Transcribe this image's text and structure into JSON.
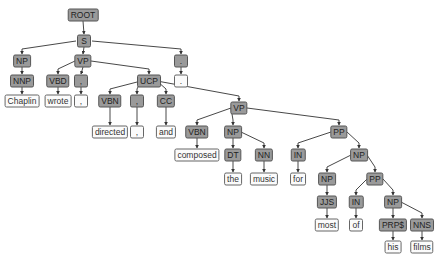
{
  "sentence": "Chaplin wrote , directed , and composed the music for most of his films .",
  "colors": {
    "tag_fill": "#9a9a9a",
    "word_fill": "#fbfbfb",
    "edge": "#333333"
  },
  "nodes": [
    {
      "id": "root",
      "label": "ROOT",
      "type": "tag",
      "x": 83,
      "y": 15
    },
    {
      "id": "s",
      "label": "S",
      "type": "tag",
      "x": 84,
      "y": 41
    },
    {
      "id": "np1",
      "label": "NP",
      "type": "tag",
      "x": 22,
      "y": 61
    },
    {
      "id": "vp1",
      "label": "VP",
      "type": "tag",
      "x": 83,
      "y": 61
    },
    {
      "id": "punct_s",
      "label": ".",
      "type": "tag",
      "x": 181,
      "y": 61
    },
    {
      "id": "nnp",
      "label": "NNP",
      "type": "tag",
      "x": 22,
      "y": 81
    },
    {
      "id": "vbd",
      "label": "VBD",
      "type": "tag",
      "x": 58,
      "y": 81
    },
    {
      "id": "comma1",
      "label": ",",
      "type": "tag",
      "x": 81,
      "y": 81
    },
    {
      "id": "ucp",
      "label": "UCP",
      "type": "tag",
      "x": 149,
      "y": 81
    },
    {
      "id": "dot_w",
      "label": ".",
      "type": "word",
      "x": 181,
      "y": 81
    },
    {
      "id": "w_chaplin",
      "label": "Chaplin",
      "type": "word",
      "x": 22,
      "y": 101
    },
    {
      "id": "w_wrote",
      "label": "wrote",
      "type": "word",
      "x": 58,
      "y": 101
    },
    {
      "id": "w_comma1",
      "label": ",",
      "type": "word",
      "x": 81,
      "y": 101
    },
    {
      "id": "vbn1",
      "label": "VBN",
      "type": "tag",
      "x": 110,
      "y": 101
    },
    {
      "id": "comma2",
      "label": ",",
      "type": "tag",
      "x": 137,
      "y": 101
    },
    {
      "id": "cc",
      "label": "CC",
      "type": "tag",
      "x": 166,
      "y": 101
    },
    {
      "id": "vp2",
      "label": "VP",
      "type": "tag",
      "x": 239,
      "y": 108
    },
    {
      "id": "w_directed",
      "label": "directed",
      "type": "word",
      "x": 110,
      "y": 132
    },
    {
      "id": "w_comma2",
      "label": ",",
      "type": "word",
      "x": 137,
      "y": 132
    },
    {
      "id": "w_and",
      "label": "and",
      "type": "word",
      "x": 166,
      "y": 132
    },
    {
      "id": "vbn2",
      "label": "VBN",
      "type": "tag",
      "x": 197,
      "y": 132
    },
    {
      "id": "np2",
      "label": "NP",
      "type": "tag",
      "x": 233,
      "y": 132
    },
    {
      "id": "pp1",
      "label": "PP",
      "type": "tag",
      "x": 339,
      "y": 132
    },
    {
      "id": "w_composed",
      "label": "composed",
      "type": "word",
      "x": 197,
      "y": 155
    },
    {
      "id": "dt",
      "label": "DT",
      "type": "tag",
      "x": 233,
      "y": 155
    },
    {
      "id": "nn",
      "label": "NN",
      "type": "tag",
      "x": 264,
      "y": 155
    },
    {
      "id": "in1",
      "label": "IN",
      "type": "tag",
      "x": 298,
      "y": 155
    },
    {
      "id": "np3",
      "label": "NP",
      "type": "tag",
      "x": 359,
      "y": 155
    },
    {
      "id": "w_the",
      "label": "the",
      "type": "word",
      "x": 233,
      "y": 179
    },
    {
      "id": "w_music",
      "label": "music",
      "type": "word",
      "x": 264,
      "y": 179
    },
    {
      "id": "w_for",
      "label": "for",
      "type": "word",
      "x": 298,
      "y": 179
    },
    {
      "id": "np4",
      "label": "NP",
      "type": "tag",
      "x": 327,
      "y": 179
    },
    {
      "id": "pp2",
      "label": "PP",
      "type": "tag",
      "x": 375,
      "y": 179
    },
    {
      "id": "jjs",
      "label": "JJS",
      "type": "tag",
      "x": 327,
      "y": 202
    },
    {
      "id": "in2",
      "label": "IN",
      "type": "tag",
      "x": 356,
      "y": 202
    },
    {
      "id": "np5",
      "label": "NP",
      "type": "tag",
      "x": 393,
      "y": 202
    },
    {
      "id": "w_most",
      "label": "most",
      "type": "word",
      "x": 327,
      "y": 225
    },
    {
      "id": "w_of",
      "label": "of",
      "type": "word",
      "x": 356,
      "y": 225
    },
    {
      "id": "prps",
      "label": "PRP$",
      "type": "tag",
      "x": 393,
      "y": 225
    },
    {
      "id": "nns",
      "label": "NNS",
      "type": "tag",
      "x": 422,
      "y": 225
    },
    {
      "id": "w_his",
      "label": "his",
      "type": "word",
      "x": 393,
      "y": 247
    },
    {
      "id": "w_films",
      "label": "films",
      "type": "word",
      "x": 422,
      "y": 247
    }
  ],
  "edges": [
    [
      "root",
      "s"
    ],
    [
      "s",
      "np1"
    ],
    [
      "s",
      "vp1"
    ],
    [
      "s",
      "punct_s"
    ],
    [
      "np1",
      "nnp"
    ],
    [
      "nnp",
      "w_chaplin"
    ],
    [
      "vp1",
      "vbd"
    ],
    [
      "vp1",
      "comma1"
    ],
    [
      "vp1",
      "ucp"
    ],
    [
      "punct_s",
      "dot_w"
    ],
    [
      "vbd",
      "w_wrote"
    ],
    [
      "comma1",
      "w_comma1"
    ],
    [
      "ucp",
      "vbn1"
    ],
    [
      "ucp",
      "comma2"
    ],
    [
      "ucp",
      "cc"
    ],
    [
      "ucp",
      "vp2"
    ],
    [
      "vbn1",
      "w_directed"
    ],
    [
      "comma2",
      "w_comma2"
    ],
    [
      "cc",
      "w_and"
    ],
    [
      "vp2",
      "vbn2"
    ],
    [
      "vp2",
      "np2"
    ],
    [
      "vp2",
      "pp1"
    ],
    [
      "vbn2",
      "w_composed"
    ],
    [
      "np2",
      "dt"
    ],
    [
      "np2",
      "nn"
    ],
    [
      "dt",
      "w_the"
    ],
    [
      "nn",
      "w_music"
    ],
    [
      "pp1",
      "in1"
    ],
    [
      "pp1",
      "np3"
    ],
    [
      "in1",
      "w_for"
    ],
    [
      "np3",
      "np4"
    ],
    [
      "np3",
      "pp2"
    ],
    [
      "np4",
      "jjs"
    ],
    [
      "jjs",
      "w_most"
    ],
    [
      "pp2",
      "in2"
    ],
    [
      "pp2",
      "np5"
    ],
    [
      "in2",
      "w_of"
    ],
    [
      "np5",
      "prps"
    ],
    [
      "np5",
      "nns"
    ],
    [
      "prps",
      "w_his"
    ],
    [
      "nns",
      "w_films"
    ]
  ]
}
